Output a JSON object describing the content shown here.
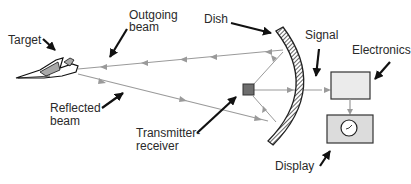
{
  "diagram": {
    "labels": {
      "target": "Target",
      "outgoing_beam_line1": "Outgoing",
      "outgoing_beam_line2": "beam",
      "dish": "Dish",
      "signal": "Signal",
      "electronics": "Electronics",
      "reflected_beam_line1": "Reflected",
      "reflected_beam_line2": "beam",
      "transmitter_line1": "Transmitter-",
      "transmitter_line2": "receiver",
      "display": "Display"
    },
    "nodes": [
      {
        "id": "target",
        "label": "Target",
        "shape": "aircraft"
      },
      {
        "id": "dish",
        "label": "Dish",
        "shape": "hatched-arc"
      },
      {
        "id": "transmitter-receiver",
        "label": "Transmitter-receiver",
        "shape": "small-square"
      },
      {
        "id": "electronics",
        "label": "Electronics",
        "shape": "box"
      },
      {
        "id": "display",
        "label": "Display",
        "shape": "box-with-dial"
      }
    ],
    "edges": [
      {
        "from": "transmitter-receiver",
        "to": "dish",
        "label": ""
      },
      {
        "from": "dish",
        "to": "target",
        "label": "Outgoing beam"
      },
      {
        "from": "target",
        "to": "dish",
        "label": "Reflected beam"
      },
      {
        "from": "dish",
        "to": "transmitter-receiver",
        "label": ""
      },
      {
        "from": "transmitter-receiver",
        "to": "electronics",
        "label": "Signal"
      },
      {
        "from": "electronics",
        "to": "display",
        "label": ""
      }
    ],
    "colors": {
      "beam": "#9a9a9a",
      "pointer_arrow": "#111111",
      "box_fill": "#e6e6e6",
      "box_stroke": "#333333",
      "transmitter_fill": "#6e6e6e",
      "plane_fill": "#a8a8a8"
    }
  }
}
